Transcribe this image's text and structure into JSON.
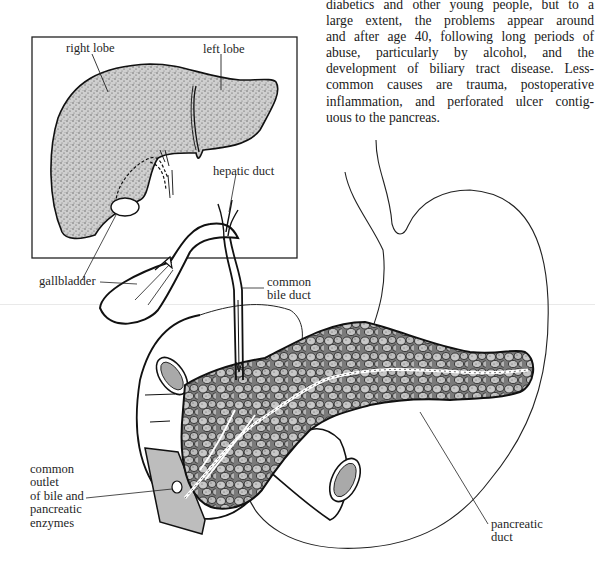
{
  "page": {
    "body_text_lines": [
      "diabetics and other young people, but to a",
      "large extent, the problems appear around",
      "and after age 40, following long periods of",
      "abuse, particularly by alcohol, and the",
      "development of biliary tract disease. Less-",
      "common causes are trauma, postoperative",
      "inflammation, and perforated ulcer contig-",
      "uous to the pancreas."
    ]
  },
  "figure": {
    "inset_liver": {
      "labels": {
        "right_lobe": "right lobe",
        "left_lobe": "left lobe"
      }
    },
    "labels": {
      "hepatic_duct": "hepatic duct",
      "gallbladder": "gallbladder",
      "common_bile_duct_1": "common",
      "common_bile_duct_2": "bile duct",
      "common_outlet_1": "common",
      "common_outlet_2": "outlet",
      "common_outlet_3": "of bile and",
      "common_outlet_4": "pancreatic",
      "common_outlet_5": "enzymes",
      "pancreatic_duct_1": "pancreatic",
      "pancreatic_duct_2": "duct"
    },
    "colors": {
      "ink": "#111111",
      "stipple_fill": "#bdbdbd",
      "duct_lumen": "#a9a9a9",
      "paper": "#ffffff"
    }
  }
}
